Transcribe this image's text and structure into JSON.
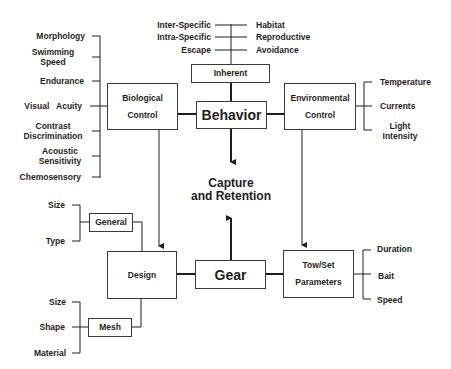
{
  "diagram": {
    "center": {
      "line1": "Capture",
      "line2": "and Retention"
    },
    "inherent": {
      "label": "Inherent",
      "left_items": [
        "Inter-Specific",
        "Intra-Specific",
        "Escape"
      ],
      "right_items": [
        "Habitat",
        "Reproductive",
        "Avoidance"
      ]
    },
    "behavior": {
      "label": "Behavior"
    },
    "biological_control": {
      "line1": "Biological",
      "line2": "Control",
      "factors": [
        {
          "line1": "Morphology",
          "line2": ""
        },
        {
          "line1": "Swimming",
          "line2": "Speed"
        },
        {
          "line1": "Endurance",
          "line2": ""
        },
        {
          "line1": "Visual   Acuity",
          "line2": ""
        },
        {
          "line1": "Contrast",
          "line2": "Discrimination"
        },
        {
          "line1": "Acoustic",
          "line2": "Sensitivity"
        },
        {
          "line1": "Chemosensory",
          "line2": ""
        }
      ]
    },
    "environmental_control": {
      "line1": "Environmental",
      "line2": "Control",
      "factors": [
        {
          "line1": "Temperature",
          "line2": ""
        },
        {
          "line1": "Currents",
          "line2": ""
        },
        {
          "line1": "Light",
          "line2": "Intensity"
        }
      ]
    },
    "gear": {
      "label": "Gear"
    },
    "design": {
      "label": "Design",
      "general": {
        "label": "General",
        "items": [
          "Size",
          "Type"
        ]
      },
      "mesh": {
        "label": "Mesh",
        "items": [
          "Size",
          "Shape",
          "Material"
        ]
      }
    },
    "tow_set": {
      "line1": "Tow/Set",
      "line2": "Parameters",
      "factors": [
        "Duration",
        "Bait",
        "Speed"
      ]
    },
    "colors": {
      "line": "#1e1e1e",
      "box_border": "#3a3a3a",
      "text": "#1e1e1e",
      "background": "#ffffff"
    }
  }
}
